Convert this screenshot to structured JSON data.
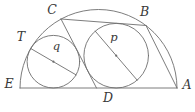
{
  "figure": {
    "type": "geometry-diagram",
    "labels": {
      "C": "C",
      "B": "B",
      "T": "T",
      "E": "E",
      "A": "A",
      "D": "D",
      "q": "q",
      "p": "p"
    },
    "colors": {
      "line": "#6e6e6e",
      "label": "#383838",
      "background": "#ffffff"
    }
  }
}
